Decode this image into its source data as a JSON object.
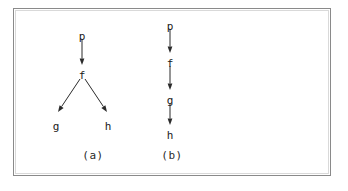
{
  "figure": {
    "panels": [
      {
        "id": "panel-a",
        "caption": "(a)",
        "caption_x": 93,
        "caption_y": 150,
        "type": "branching-tree",
        "nodes": [
          {
            "label": "p",
            "x": 82,
            "y": 31
          },
          {
            "label": "f",
            "x": 82,
            "y": 70
          },
          {
            "label": "g",
            "x": 56,
            "y": 121
          },
          {
            "label": "h",
            "x": 108,
            "y": 121
          }
        ],
        "edges": [
          {
            "from": "p",
            "to": "f",
            "x1": 82,
            "y1": 39,
            "x2": 82,
            "y2": 65
          },
          {
            "from": "f",
            "to": "g",
            "x1": 80,
            "y1": 79,
            "x2": 58,
            "y2": 112
          },
          {
            "from": "f",
            "to": "h",
            "x1": 85,
            "y1": 79,
            "x2": 107,
            "y2": 112
          }
        ]
      },
      {
        "id": "panel-b",
        "caption": "(b)",
        "caption_x": 172,
        "caption_y": 150,
        "type": "linear-chain",
        "nodes": [
          {
            "label": "p",
            "x": 170,
            "y": 21
          },
          {
            "label": "f",
            "x": 170,
            "y": 58
          },
          {
            "label": "g",
            "x": 170,
            "y": 95
          },
          {
            "label": "h",
            "x": 170,
            "y": 130
          }
        ],
        "edges": [
          {
            "from": "p",
            "to": "f",
            "x1": 170,
            "y1": 29,
            "x2": 170,
            "y2": 53
          },
          {
            "from": "f",
            "to": "g",
            "x1": 170,
            "y1": 66,
            "x2": 170,
            "y2": 90
          },
          {
            "from": "g",
            "to": "h",
            "x1": 170,
            "y1": 103,
            "x2": 170,
            "y2": 125
          }
        ]
      }
    ],
    "colors": {
      "ink": "#2b2b2b",
      "frame": "#8a8a8a",
      "background": "#ffffff"
    }
  }
}
